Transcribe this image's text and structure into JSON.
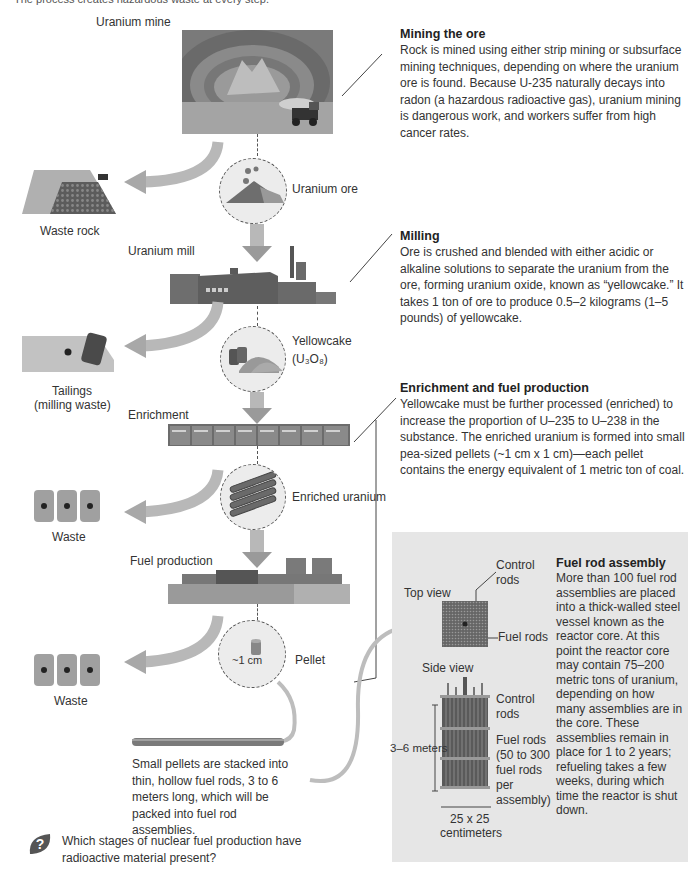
{
  "header": {
    "caption_partial": "The process creates hazardous waste at every step."
  },
  "stages": {
    "mine": {
      "label": "Uranium mine"
    },
    "ore": {
      "label": "Uranium ore"
    },
    "waste_rock": {
      "label": "Waste rock"
    },
    "mill": {
      "label": "Uranium mill"
    },
    "yellowcake": {
      "label": "Yellowcake",
      "formula": "(U₃O₈)"
    },
    "tailings": {
      "label_line1": "Tailings",
      "label_line2": "(milling waste)"
    },
    "enrichment": {
      "label": "Enrichment"
    },
    "enriched_uranium": {
      "label": "Enriched uranium"
    },
    "waste1": {
      "label": "Waste"
    },
    "fuel_production": {
      "label": "Fuel production"
    },
    "pellet": {
      "label": "Pellet",
      "size": "~1 cm"
    },
    "waste2": {
      "label": "Waste"
    },
    "fuel_rod_caption": "Small pellets are stacked into thin, hollow fuel rods, 3 to 6 meters long, which will be packed into fuel rod assemblies."
  },
  "descriptions": {
    "mining": {
      "title": "Mining the ore",
      "body": "Rock is mined using either strip mining or subsurface mining techniques, depending on where the uranium ore is found. Because U-235 naturally decays into radon (a hazardous radioactive gas), uranium mining is dangerous work, and workers suffer from high cancer rates."
    },
    "milling": {
      "title": "Milling",
      "body": "Ore is crushed and blended with either acidic or alkaline solutions to separate the uranium from the ore, forming uranium oxide, known as “yellowcake.” It takes 1 ton of ore to produce 0.5–2 kilograms (1–5 pounds) of yellowcake."
    },
    "enrichment": {
      "title": "Enrichment and fuel production",
      "body": "Yellowcake must be further processed (enriched) to increase the proportion of U–235 to U–238 in the substance. The enriched uranium is formed into small pea-sized pellets (~1 cm x 1 cm)—each pellet contains the energy equivalent of 1 metric ton of coal."
    }
  },
  "assembly_box": {
    "top_view": "Top view",
    "side_view": "Side view",
    "control_rods_top": "Control rods",
    "fuel_rods_top": "Fuel rods",
    "control_rods_side": "Control rods",
    "fuel_rods_side": "Fuel rods (50 to 300 fuel rods per assembly)",
    "height_dim": "3–6 meters",
    "width_dim_line1": "25 x 25",
    "width_dim_line2": "centimeters",
    "title": "Fuel rod assembly",
    "body": "More than 100 fuel rod assemblies are placed into a thick-walled steel vessel known as the reactor core. At this point the reactor core may contain 75–200 metric tons of uranium, depending on how many assemblies are in the core. These assemblies remain in place for 1 to 2 years; refueling takes a few weeks, during which time the reactor is shut down."
  },
  "question": {
    "icon": "question-leaf-icon",
    "text": "Which stages of nuclear fuel production have radioactive material present?"
  },
  "colors": {
    "arrow": "#b5b5b5",
    "box_bg": "#e6e6e6",
    "building": "#6e6e6e"
  }
}
